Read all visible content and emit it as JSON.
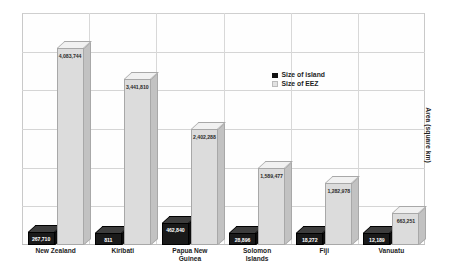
{
  "chart_data": {
    "type": "bar",
    "title": "",
    "xlabel": "",
    "ylabel": "Area (square km)",
    "categories": [
      "New Zealand",
      "Kiribati",
      "Papua New\nGuinea",
      "Solomon\nIslands",
      "Fiji",
      "Vanuatu"
    ],
    "series": [
      {
        "name": "Size of island",
        "values": [
          267710,
          811,
          462840,
          28896,
          18272,
          12189
        ],
        "labels": [
          "267,710",
          "811",
          "462,840",
          "28,896",
          "18,272",
          "12,189"
        ],
        "color": "#121212"
      },
      {
        "name": "Size of EEZ",
        "values": [
          4083744,
          3441810,
          2402288,
          1589477,
          1282978,
          663251
        ],
        "labels": [
          "4,083,744",
          "3,441,810",
          "2,402,288",
          "1,589,477",
          "1,282,978",
          "663,251"
        ],
        "color": "#e2e2e2"
      }
    ],
    "ylim": [
      0,
      4800000
    ],
    "grid": true,
    "gridlines": [
      800000,
      1600000,
      2400000,
      3200000,
      4000000
    ],
    "legend_position": "inside-upper-right"
  },
  "legend": {
    "items": [
      {
        "label": "Size of island",
        "style": "dark"
      },
      {
        "label": "Size of EEZ",
        "style": "light"
      }
    ]
  },
  "axis": {
    "y_title": "Area (square km)"
  }
}
